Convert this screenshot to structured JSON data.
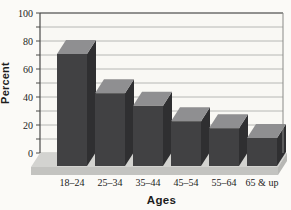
{
  "chart_data": {
    "type": "bar",
    "style": "3d-extruded-bars-on-platform",
    "title": "",
    "xlabel": "Ages",
    "ylabel": "Percent",
    "categories": [
      "18–24",
      "25–34",
      "35–44",
      "45–54",
      "55–64",
      "65 & up"
    ],
    "values": [
      80,
      52,
      43,
      32,
      27,
      20
    ],
    "ylim": [
      0,
      100
    ],
    "ytick_labels": [
      "0",
      "20",
      "40",
      "60",
      "80",
      "100"
    ],
    "grid_step": 10,
    "grid": "on",
    "legend": "none",
    "colors": {
      "bar_front": "#414143",
      "bar_top": "#8f8f91",
      "bar_side": "#2f2f31",
      "platform_top": "#d3d3d0",
      "platform_front": "#c3c3c0",
      "platform_side": "#b7b7b4",
      "wall": "#f9f8f4",
      "gridline": "#a6a6a4",
      "frame": "#4a4a48",
      "text": "#1c1c1c",
      "page_bg": "#fbfaf7"
    }
  }
}
